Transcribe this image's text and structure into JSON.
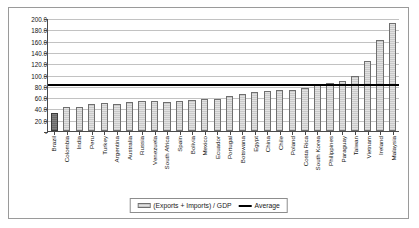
{
  "chart_data": {
    "type": "bar",
    "title": "",
    "subtitle": "",
    "xlabel": "",
    "ylabel": "",
    "ylim": [
      0,
      200
    ],
    "ytick_step": 20,
    "ytick_labels": [
      "200.0",
      "180.0",
      "160.0",
      "140.0",
      "120.0",
      "100.0",
      "80.0",
      "60.0",
      "40.0",
      "20.0",
      "-"
    ],
    "ytick_values": [
      200,
      180,
      160,
      140,
      120,
      100,
      80,
      60,
      40,
      20,
      0
    ],
    "grid": true,
    "legend_position": "bottom-center",
    "categories": [
      "Brazil",
      "Colombia",
      "India",
      "Peru",
      "Turkey",
      "Argentina",
      "Australia",
      "Russia",
      "Venezuela",
      "South Africa",
      "Spain",
      "Bolivia",
      "Mexico",
      "Ecuador",
      "Portugal",
      "Botswana",
      "Egypt",
      "China",
      "Chile",
      "Poland",
      "Costa Rica",
      "South Korea",
      "Philippines",
      "Paraguay",
      "Taiwan",
      "Vietnam",
      "Ireland",
      "Malaysia"
    ],
    "values": [
      33,
      42,
      43,
      48,
      50,
      49,
      51,
      53,
      53,
      52,
      54,
      55,
      57,
      58,
      63,
      66,
      70,
      72,
      73,
      74,
      77,
      83,
      86,
      90,
      98,
      125,
      163,
      193
    ],
    "highlight_category": "Brazil",
    "series": [
      {
        "name": "(Exports + Imports) / GDP",
        "type": "bar",
        "values": [
          33,
          42,
          43,
          48,
          50,
          49,
          51,
          53,
          53,
          52,
          54,
          55,
          57,
          58,
          63,
          66,
          70,
          72,
          73,
          74,
          77,
          83,
          86,
          90,
          98,
          125,
          163,
          193
        ]
      },
      {
        "name": "Average",
        "type": "line",
        "value": 80
      }
    ],
    "average_value": 80,
    "legend": [
      {
        "label": "(Exports + Imports) / GDP",
        "marker": "bar-swatch"
      },
      {
        "label": "Average",
        "marker": "line-swatch"
      }
    ]
  }
}
